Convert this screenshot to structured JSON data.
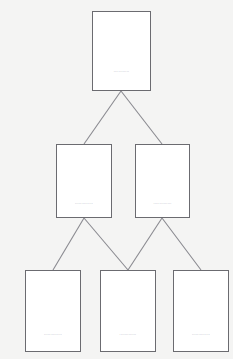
{
  "diagram": {
    "type": "hierarchy-tree",
    "background_color": "#f4f4f3",
    "node_fill_color": "#ffffff",
    "node_border_color": "#6b6b70",
    "connector_color": "#8a8a90",
    "label_color": "#6e6e73",
    "levels": 3,
    "nodes": [
      {
        "id": "root",
        "level": 0,
        "label": "............",
        "x": 92,
        "y": 11,
        "width": 59,
        "height": 80
      },
      {
        "id": "middle-left",
        "level": 1,
        "label": "..............",
        "x": 56,
        "y": 144,
        "width": 56,
        "height": 74
      },
      {
        "id": "middle-right",
        "level": 1,
        "label": "..............",
        "x": 135,
        "y": 144,
        "width": 55,
        "height": 74
      },
      {
        "id": "leaf-left",
        "level": 2,
        "label": "..............",
        "x": 25,
        "y": 270,
        "width": 56,
        "height": 82
      },
      {
        "id": "leaf-middle",
        "level": 2,
        "label": ".............",
        "x": 100,
        "y": 270,
        "width": 56,
        "height": 82
      },
      {
        "id": "leaf-right",
        "level": 2,
        "label": "..............",
        "x": 173,
        "y": 270,
        "width": 56,
        "height": 82
      }
    ],
    "connectors": [
      {
        "id": "root-to-middle-left",
        "from": "root",
        "to": "middle-left",
        "x1": 121,
        "y1": 91,
        "x2": 84,
        "y2": 144
      },
      {
        "id": "root-to-middle-right",
        "from": "root",
        "to": "middle-right",
        "x1": 121,
        "y1": 91,
        "x2": 162,
        "y2": 144
      },
      {
        "id": "middle-left-to-leaf-left",
        "from": "middle-left",
        "to": "leaf-left",
        "x1": 84,
        "y1": 218,
        "x2": 53,
        "y2": 270
      },
      {
        "id": "middle-left-to-leaf-middle",
        "from": "middle-left",
        "to": "leaf-middle",
        "x1": 84,
        "y1": 218,
        "x2": 128,
        "y2": 270
      },
      {
        "id": "middle-right-to-leaf-middle",
        "from": "middle-right",
        "to": "leaf-middle",
        "x1": 162,
        "y1": 218,
        "x2": 128,
        "y2": 270
      },
      {
        "id": "middle-right-to-leaf-right",
        "from": "middle-right",
        "to": "leaf-right",
        "x1": 162,
        "y1": 218,
        "x2": 201,
        "y2": 270
      }
    ]
  }
}
